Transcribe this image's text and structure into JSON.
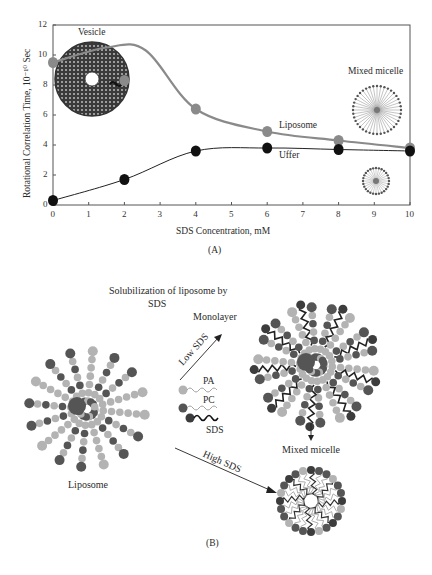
{
  "panel_a": {
    "label": "(A)",
    "annotations": {
      "vesicle": "Vesicle",
      "mixed_micelle": "Mixed micelle",
      "liposome": "Liposome",
      "uffer": "Uffer"
    }
  },
  "panel_b": {
    "label": "(B)",
    "title_line1": "Solubilization of liposome  by",
    "title_line2": "SDS",
    "monolayer": "Monolayer",
    "low_sds": "Low SDS",
    "high_sds": "High SDS",
    "liposome": "Liposome",
    "mixed_micelle": "Mixed micelle",
    "legend": {
      "pa": "PA",
      "pc": "PC",
      "sds": "SDS"
    }
  },
  "colors": {
    "liposome_series": "#8a8a8a",
    "uffer_series": "#111111",
    "dark_head": "#555555",
    "light_head": "#b3b3b3",
    "sds_head": "#3c3c3c"
  },
  "chart_data": {
    "type": "line",
    "title": "",
    "xlabel": "SDS Concentration, mM",
    "ylabel": "Rotational Correlation Time, 10⁻¹⁰ Sec",
    "x": [
      0,
      2,
      4,
      6,
      8,
      10
    ],
    "xticks": [
      "0",
      "1",
      "2",
      "3",
      "4",
      "5",
      "6",
      "7",
      "8",
      "9",
      "10"
    ],
    "yticks": [
      "0",
      "2",
      "4",
      "6",
      "8",
      "10",
      "12"
    ],
    "xlim": [
      0,
      10
    ],
    "ylim": [
      0,
      12
    ],
    "grid": false,
    "legend_position": "inline annotations",
    "series": [
      {
        "name": "Liposome",
        "values": [
          9.5,
          8.3,
          6.4,
          4.9,
          4.3,
          3.8
        ]
      },
      {
        "name": "Uffer",
        "values": [
          0.3,
          1.7,
          3.6,
          3.8,
          3.7,
          3.6
        ]
      }
    ]
  }
}
